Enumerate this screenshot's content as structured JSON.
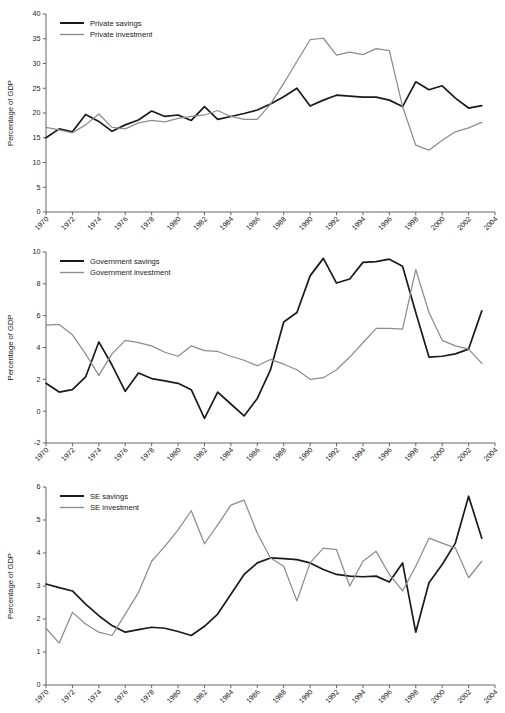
{
  "figure": {
    "ylabel": "Percentage of GDP",
    "colors": {
      "savings": "#1a1a1a",
      "investment": "#8c8c8c",
      "axis": "#555555"
    }
  },
  "chart_data": [
    {
      "type": "line",
      "title": "",
      "xlabel": "",
      "ylabel": "Percentage of GDP",
      "grid": false,
      "legend_position": "top-left",
      "xlim": [
        1970,
        2004
      ],
      "ylim": [
        0,
        40
      ],
      "yticks": [
        0,
        5,
        10,
        15,
        20,
        25,
        30,
        35,
        40
      ],
      "xticks": [
        1970,
        1972,
        1974,
        1976,
        1978,
        1980,
        1982,
        1984,
        1986,
        1988,
        1990,
        1992,
        1994,
        1996,
        1998,
        2000,
        2002,
        2004
      ],
      "x": [
        1970,
        1971,
        1972,
        1973,
        1974,
        1975,
        1976,
        1977,
        1978,
        1979,
        1980,
        1981,
        1982,
        1983,
        1984,
        1985,
        1986,
        1987,
        1988,
        1989,
        1990,
        1991,
        1992,
        1993,
        1994,
        1995,
        1996,
        1997,
        1998,
        1999,
        2000,
        2001,
        2002,
        2003
      ],
      "series": [
        {
          "name": "Private savings",
          "color": "#1a1a1a",
          "values": [
            15.0,
            16.8,
            16.2,
            19.7,
            18.3,
            16.3,
            17.6,
            18.6,
            20.4,
            19.3,
            19.6,
            18.5,
            21.3,
            18.7,
            19.3,
            19.9,
            20.6,
            21.8,
            23.3,
            25.0,
            21.4,
            22.6,
            23.6,
            23.4,
            23.2,
            23.2,
            22.6,
            21.3,
            26.3,
            24.7,
            25.5,
            23.0,
            21.0,
            21.5
          ]
        },
        {
          "name": "Private investment",
          "color": "#8c8c8c",
          "values": [
            17.1,
            16.6,
            16.0,
            17.6,
            19.8,
            17.1,
            16.8,
            18.0,
            18.5,
            18.2,
            18.9,
            19.3,
            19.6,
            20.5,
            19.3,
            18.7,
            18.7,
            21.8,
            26.0,
            30.4,
            34.8,
            35.1,
            31.7,
            32.3,
            31.8,
            33.0,
            32.6,
            21.3,
            13.5,
            12.5,
            14.5,
            16.2,
            17.0,
            18.1
          ]
        }
      ]
    },
    {
      "type": "line",
      "title": "",
      "xlabel": "",
      "ylabel": "Percentage of GDP",
      "grid": false,
      "legend_position": "top-left",
      "xlim": [
        1970,
        2004
      ],
      "ylim": [
        -2,
        10
      ],
      "yticks": [
        -2,
        0,
        2,
        4,
        6,
        8,
        10
      ],
      "xticks": [
        1970,
        1972,
        1974,
        1976,
        1978,
        1980,
        1982,
        1984,
        1986,
        1988,
        1990,
        1992,
        1994,
        1996,
        1998,
        2000,
        2002,
        2004
      ],
      "x": [
        1970,
        1971,
        1972,
        1973,
        1974,
        1975,
        1976,
        1977,
        1978,
        1979,
        1980,
        1981,
        1982,
        1983,
        1984,
        1985,
        1986,
        1987,
        1988,
        1989,
        1990,
        1991,
        1992,
        1993,
        1994,
        1995,
        1996,
        1997,
        1998,
        1999,
        2000,
        2001,
        2002,
        2003
      ],
      "series": [
        {
          "name": "Government savings",
          "color": "#1a1a1a",
          "values": [
            1.75,
            1.2,
            1.35,
            2.15,
            4.35,
            2.9,
            1.25,
            2.4,
            2.05,
            1.9,
            1.75,
            1.35,
            -0.45,
            1.2,
            0.45,
            -0.3,
            0.8,
            2.6,
            5.6,
            6.2,
            8.5,
            9.6,
            8.05,
            8.3,
            9.35,
            9.4,
            9.55,
            9.1,
            6.2,
            3.4,
            3.45,
            3.6,
            3.9,
            6.3
          ]
        },
        {
          "name": "Government investment",
          "color": "#8c8c8c",
          "values": [
            5.4,
            5.45,
            4.8,
            3.6,
            2.25,
            3.6,
            4.45,
            4.3,
            4.1,
            3.7,
            3.45,
            4.1,
            3.8,
            3.75,
            3.45,
            3.2,
            2.85,
            3.25,
            2.95,
            2.6,
            2.0,
            2.1,
            2.6,
            3.4,
            4.3,
            5.2,
            5.2,
            5.15,
            8.9,
            6.2,
            4.45,
            4.1,
            3.9,
            3.0
          ]
        }
      ]
    },
    {
      "type": "line",
      "title": "",
      "xlabel": "",
      "ylabel": "Percentage of GDP",
      "grid": false,
      "legend_position": "top-left",
      "xlim": [
        1970,
        2004
      ],
      "ylim": [
        0,
        6
      ],
      "yticks": [
        0,
        1,
        2,
        3,
        4,
        5,
        6
      ],
      "xticks": [
        1970,
        1972,
        1974,
        1976,
        1978,
        1980,
        1982,
        1984,
        1986,
        1988,
        1990,
        1992,
        1994,
        1996,
        1998,
        2000,
        2002,
        2004
      ],
      "x": [
        1970,
        1971,
        1972,
        1973,
        1974,
        1975,
        1976,
        1977,
        1978,
        1979,
        1980,
        1981,
        1982,
        1983,
        1984,
        1985,
        1986,
        1987,
        1988,
        1989,
        1990,
        1991,
        1992,
        1993,
        1994,
        1995,
        1996,
        1997,
        1998,
        1999,
        2000,
        2001,
        2002,
        2003
      ],
      "series": [
        {
          "name": "SE savings",
          "color": "#1a1a1a",
          "values": [
            3.06,
            2.95,
            2.85,
            2.45,
            2.1,
            1.8,
            1.6,
            1.68,
            1.75,
            1.72,
            1.62,
            1.5,
            1.78,
            2.15,
            2.75,
            3.35,
            3.7,
            3.85,
            3.83,
            3.8,
            3.7,
            3.5,
            3.35,
            3.3,
            3.28,
            3.3,
            3.12,
            3.7,
            1.6,
            3.1,
            3.65,
            4.3,
            5.72,
            4.45
          ]
        },
        {
          "name": "SE investment",
          "color": "#8c8c8c",
          "values": [
            1.72,
            1.27,
            2.2,
            1.85,
            1.6,
            1.5,
            2.15,
            2.8,
            3.75,
            4.2,
            4.7,
            5.28,
            4.28,
            4.85,
            5.45,
            5.6,
            4.6,
            3.85,
            3.6,
            2.55,
            3.7,
            4.15,
            4.1,
            3.0,
            3.75,
            4.05,
            3.35,
            2.85,
            3.6,
            4.45,
            4.3,
            4.15,
            3.25,
            3.75
          ]
        }
      ]
    }
  ]
}
